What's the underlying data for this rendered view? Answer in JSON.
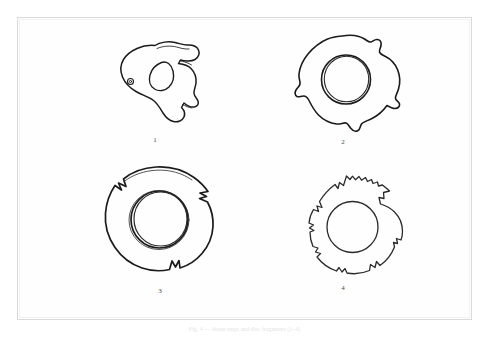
{
  "plate": {
    "background_color": "#ffffff",
    "frame_color": "#d9dadb",
    "ink_color": "#1b1b1b",
    "label_color": "#4a4a4a",
    "caption_color": "#e4e4e5",
    "caption": "Fig. 4 — Stone rings and disc fragments (1–4)"
  },
  "figures": [
    {
      "id": "fig-1",
      "label": "1",
      "name": "ring-fragment-with-teardrop-perforation",
      "description": "Irregular fragment of a ring with a large teardrop-shaped perforation and a small circular dot on the left edge",
      "hole_style": "single-line-teardrop",
      "edge_style": "irregular-broken",
      "label_x": 155,
      "label_y": 141
    },
    {
      "id": "fig-2",
      "label": "2",
      "name": "annular-ring-with-notched-rim",
      "description": "Annular ring with wavy notched outer rim and double-line circular central perforation",
      "hole_style": "double-line-circle",
      "edge_style": "wavy-notched",
      "label_x": 343,
      "label_y": 146
    },
    {
      "id": "fig-3",
      "label": "3",
      "name": "large-disc-ring-with-v-notches",
      "description": "Large smooth disc ring with three sharp V-notches on the rim and a double-line circular central perforation",
      "hole_style": "double-line-circle",
      "edge_style": "smooth-with-v-notches",
      "label_x": 159,
      "label_y": 299
    },
    {
      "id": "fig-4",
      "label": "4",
      "name": "ring-with-crenellated-rim",
      "description": "Ring with jagged crenellated outer rim, two rim notches and a single-line circular central perforation",
      "hole_style": "single-line-circle",
      "edge_style": "jagged-crenellated",
      "label_x": 343,
      "label_y": 296
    }
  ]
}
